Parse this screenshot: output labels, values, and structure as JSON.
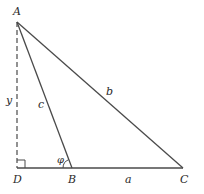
{
  "diagram": {
    "colors": {
      "background": "#ffffff",
      "stroke": "#4a4a4a",
      "text": "#2a2a2a"
    },
    "vertices": {
      "A": {
        "label": "A",
        "x": 17,
        "y": 22
      },
      "B": {
        "label": "B",
        "x": 72,
        "y": 168
      },
      "C": {
        "label": "C",
        "x": 183,
        "y": 168
      },
      "D": {
        "label": "D",
        "x": 17,
        "y": 168
      }
    },
    "sides": {
      "a": {
        "label": "a",
        "from": "B",
        "to": "C"
      },
      "b": {
        "label": "b",
        "from": "A",
        "to": "C"
      },
      "c": {
        "label": "c",
        "from": "A",
        "to": "B"
      },
      "y": {
        "label": "y",
        "from": "A",
        "to": "D",
        "style": "dashed"
      }
    },
    "angle": {
      "label": "φ",
      "at": "B"
    },
    "right_angle_at": "D",
    "base_line": {
      "from": "D",
      "to": "C"
    }
  }
}
